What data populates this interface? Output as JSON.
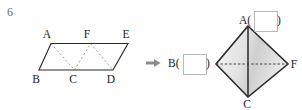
{
  "question": {
    "number": "6"
  },
  "arrow": {
    "glyph": "right-arrow",
    "color": "#8d8d8d"
  },
  "left_figure": {
    "name": "parallelogram-ABED",
    "shape": "parallelogram",
    "vertex_labels": {
      "top_left": "A",
      "top_mid": "F",
      "top_right": "E",
      "bottom_left": "B",
      "bottom_mid": "C",
      "bottom_right": "D"
    },
    "solid_edges": [
      "A-E",
      "E-D",
      "D-B",
      "B-A"
    ],
    "dashed_edges": [
      "A-C",
      "C-F",
      "F-D"
    ],
    "stroke_color": "#2a2a2a",
    "dash_color": "#9a9a9a"
  },
  "right_figure": {
    "name": "rhombus-ABCF",
    "shape": "rhombus",
    "vertex_labels": {
      "top": "A",
      "left": "B",
      "right": "F",
      "bottom": "C"
    },
    "solid_edges": [
      "A-B",
      "B-C",
      "C-F",
      "F-A",
      "A-C"
    ],
    "dashed_edges": [
      "B-F"
    ],
    "stroke_color": "#2a2a2a",
    "fill_light": "#f2f2f2",
    "fill_dark": "#c9c9c9"
  },
  "answers": {
    "top": {
      "prefix": "A(",
      "value": "",
      "suffix": ")"
    },
    "left": {
      "prefix": "B(",
      "value": "",
      "suffix": ")"
    }
  }
}
